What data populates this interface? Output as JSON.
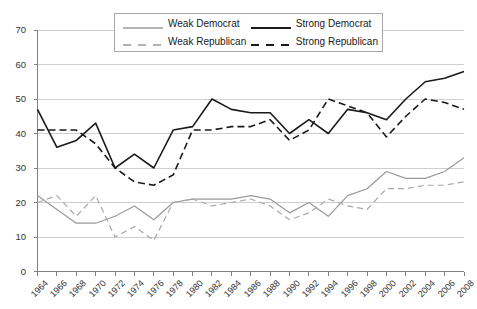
{
  "chart_data": {
    "type": "line",
    "title": "",
    "subtitle": "",
    "xlabel": "",
    "ylabel": "",
    "xlim": [
      1964,
      2008
    ],
    "ylim": [
      0,
      70
    ],
    "ytick_step": 10,
    "xtick_step": 2,
    "grid": "horizontal",
    "legend_position": "top-center",
    "categories": [
      "1964",
      "1966",
      "1968",
      "1970",
      "1972",
      "1974",
      "1976",
      "1978",
      "1980",
      "1982",
      "1984",
      "1986",
      "1988",
      "1990",
      "1992",
      "1994",
      "1996",
      "1998",
      "2000",
      "2002",
      "2004",
      "2006",
      "2008"
    ],
    "x": [
      1964,
      1966,
      1968,
      1970,
      1972,
      1974,
      1976,
      1978,
      1980,
      1982,
      1984,
      1986,
      1988,
      1990,
      1992,
      1994,
      1996,
      1998,
      2000,
      2002,
      2004,
      2006,
      2008
    ],
    "yticks": [
      0,
      10,
      20,
      30,
      40,
      50,
      60,
      70
    ],
    "series": [
      {
        "name": "Weak Democrat",
        "color": "#9a9a9a",
        "dash": "solid",
        "values": [
          22,
          18,
          14,
          14,
          16,
          19,
          15,
          20,
          21,
          21,
          21,
          22,
          21,
          17,
          20,
          16,
          22,
          24,
          29,
          27,
          27,
          29,
          33
        ]
      },
      {
        "name": "Weak Republican",
        "color": "#a8a8a8",
        "dash": "dashed",
        "values": [
          20,
          22,
          16,
          22,
          10,
          13,
          9,
          20,
          21,
          19,
          20,
          21,
          19,
          15,
          17,
          21,
          19,
          18,
          24,
          24,
          25,
          25,
          26
        ]
      },
      {
        "name": "Strong Democrat",
        "color": "#1a1a1a",
        "dash": "solid",
        "values": [
          47,
          36,
          38,
          43,
          30,
          34,
          30,
          41,
          42,
          50,
          47,
          46,
          46,
          40,
          44,
          40,
          47,
          46,
          44,
          50,
          55,
          56,
          58
        ]
      },
      {
        "name": "Strong Republican",
        "color": "#1a1a1a",
        "dash": "dashed",
        "values": [
          41,
          41,
          41,
          37,
          30,
          26,
          25,
          28,
          41,
          41,
          42,
          42,
          44,
          38,
          41,
          50,
          48,
          46,
          39,
          45,
          50,
          49,
          47
        ]
      }
    ]
  },
  "legend": {
    "entries": [
      {
        "label": "Weak Democrat",
        "swatch": "line-solid-grey"
      },
      {
        "label": "Strong Democrat",
        "swatch": "line-solid-black"
      },
      {
        "label": "Weak Republican",
        "swatch": "line-dashed-grey"
      },
      {
        "label": "Strong Republican",
        "swatch": "line-dashed-black"
      }
    ]
  },
  "colors": {
    "weak_grey": "#9a9a9a",
    "strong_black": "#1a1a1a",
    "gridline": "#cfcfcf",
    "axis": "#808080",
    "legend_border": "#a8a8a8",
    "text": "#333333"
  }
}
